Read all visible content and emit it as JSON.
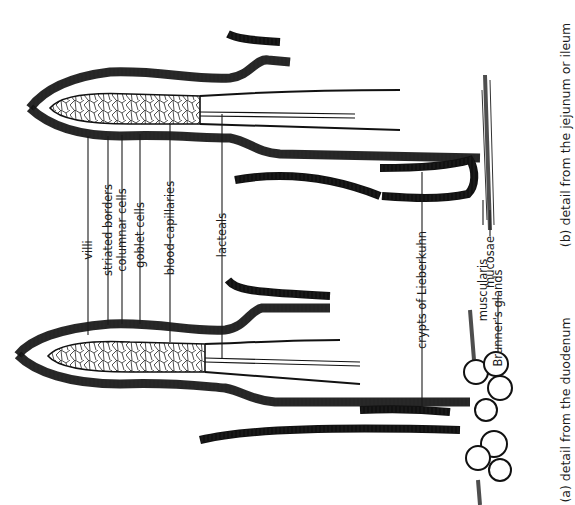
{
  "figure": {
    "panels": [
      {
        "id": "a",
        "caption": "(a) detail from the duodenum"
      },
      {
        "id": "b",
        "caption": "(b) detail from the jejunum or ileum"
      }
    ],
    "labels": {
      "villi": "villi",
      "striated_borders": "striated borders",
      "columnar_cells": "columnar cells",
      "goblet_cells": "goblet cells",
      "blood_capillaries": "blood-capillaries",
      "lacteals": "lacteals",
      "crypts": "crypts of Lieberkuhn",
      "muscularis": "muscularis",
      "mucosae": "mucosae",
      "brunners": "Brunner's glands"
    },
    "orientation": "rotated 90° counter-clockwise; villi tips point left",
    "colors": {
      "ink": "#1a1a1a",
      "background": "#ffffff"
    }
  }
}
